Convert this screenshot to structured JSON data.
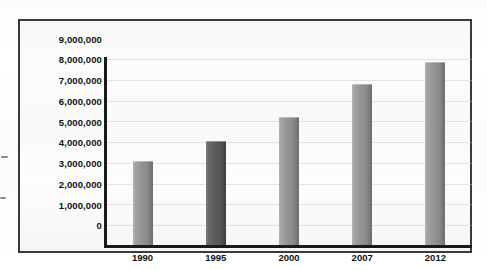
{
  "figure": {
    "frame_color": "#3a3a3a",
    "plot_background": "#fbfbfb"
  },
  "chart_data": {
    "type": "bar",
    "title": "",
    "subtitle": "",
    "xlabel": "",
    "ylabel": "",
    "categories": [
      "1990",
      "1995",
      "2000",
      "2007",
      "2012"
    ],
    "values": [
      4100000,
      5050000,
      6230000,
      7780000,
      8880000
    ],
    "series": [
      {
        "name": "",
        "values": [
          4100000,
          5050000,
          6230000,
          7780000,
          8880000
        ]
      }
    ],
    "ylim": [
      0,
      9000000
    ],
    "y_ticks": [
      0,
      1000000,
      2000000,
      3000000,
      4000000,
      5000000,
      6000000,
      7000000,
      8000000,
      9000000
    ],
    "y_tick_labels": [
      "9,000,000",
      "8,000,000",
      "7,000,000",
      "6,000,000",
      "5,000,000",
      "4,000,000",
      "3,000,000",
      "2,000,000",
      "1,000,000",
      "0"
    ],
    "x_tick_labels": [
      "1990",
      "1995",
      "2000",
      "2007",
      "2012"
    ],
    "grid": true,
    "grid_axis": "y",
    "legend": false,
    "legend_position": "none",
    "annotations": [],
    "bar_colors": [
      "#949494",
      "#5c5c5c",
      "#949494",
      "#949494",
      "#949494"
    ],
    "highlight_index": 1,
    "bar_color_default": "#949494",
    "bar_color_highlight": "#5c5c5c"
  }
}
